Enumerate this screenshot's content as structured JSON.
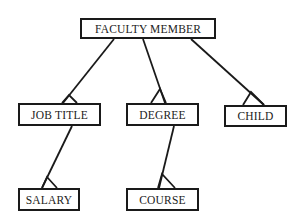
{
  "diagram": {
    "type": "hierarchy",
    "nodes": {
      "root": {
        "label": "FACULTY MEMBER"
      },
      "job_title": {
        "label": "JOB TITLE"
      },
      "degree": {
        "label": "DEGREE"
      },
      "child": {
        "label": "CHILD"
      },
      "salary": {
        "label": "SALARY"
      },
      "course": {
        "label": "COURSE"
      }
    },
    "edges": [
      {
        "from": "FACULTY MEMBER",
        "to": "JOB TITLE",
        "cardinality": "many"
      },
      {
        "from": "FACULTY MEMBER",
        "to": "DEGREE",
        "cardinality": "many"
      },
      {
        "from": "FACULTY MEMBER",
        "to": "CHILD",
        "cardinality": "many"
      },
      {
        "from": "JOB TITLE",
        "to": "SALARY",
        "cardinality": "many"
      },
      {
        "from": "DEGREE",
        "to": "COURSE",
        "cardinality": "many"
      }
    ]
  }
}
